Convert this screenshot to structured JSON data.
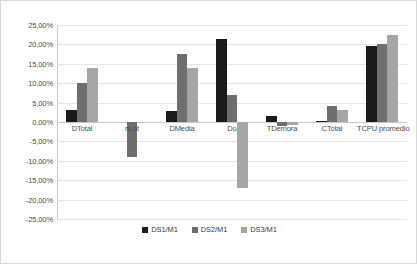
{
  "chart_data": {
    "type": "bar",
    "title": "",
    "xlabel": "",
    "ylabel": "",
    "ylim": [
      -25,
      25
    ],
    "ytick_step": 5,
    "grid": true,
    "legend_position": "bottom",
    "value_suffix": "%",
    "decimal_separator": ",",
    "categories": [
      "DTotal",
      "nLot",
      "DMedia",
      "Do",
      "TDemora",
      "CTotal",
      "TCPU promedio"
    ],
    "ytick_labels": [
      "25,00%",
      "20,00%",
      "15,00%",
      "10,00%",
      "5,00%",
      "0,00%",
      "-5,00%",
      "-10,00%",
      "-15,00%",
      "-20,00%",
      "-25,00%"
    ],
    "ytick_values": [
      25,
      20,
      15,
      10,
      5,
      0,
      -5,
      -10,
      -15,
      -20,
      -25
    ],
    "series": [
      {
        "name": "DS1/M1",
        "color": "#1a1a1a",
        "values": [
          3.0,
          0.0,
          2.8,
          21.5,
          1.5,
          0.15,
          19.5
        ]
      },
      {
        "name": "DS2/M1",
        "color": "#6e6e6e",
        "values": [
          10.0,
          -9.0,
          17.5,
          7.0,
          -1.0,
          4.0,
          20.0
        ]
      },
      {
        "name": "DS3/M1",
        "color": "#a6a6a6",
        "values": [
          14.0,
          0.0,
          14.0,
          -17.0,
          -0.7,
          3.0,
          22.5
        ]
      }
    ]
  }
}
